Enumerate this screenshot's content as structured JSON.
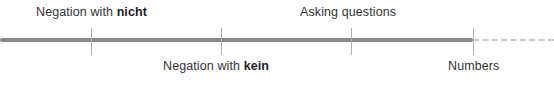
{
  "figure": {
    "type": "progress-timeline",
    "width": 554,
    "height": 87,
    "background_color": "#ffffff"
  },
  "axis": {
    "name": "course-progress-axis",
    "orientation": "horizontal",
    "center_y": 40,
    "solid": {
      "start_x": 0,
      "end_x": 473,
      "thickness": 4,
      "color": "#8a8a8e",
      "meaning": "completed"
    },
    "dashed": {
      "start_x": 473,
      "end_x": 554,
      "thickness": 2,
      "color": "#c9c9cf",
      "dash_pattern": "5px dash, 3px gap",
      "meaning": "upcoming"
    }
  },
  "tick_style": {
    "color": "#b0b0b4",
    "width": 1,
    "top_y": 28,
    "height": 27
  },
  "milestones": [
    {
      "id": "negation-nicht",
      "x": 91,
      "label_position": "above",
      "label_left": 36,
      "text_prefix": "Negation with ",
      "term": "nicht",
      "term_bold": true
    },
    {
      "id": "negation-kein",
      "x": 221,
      "label_position": "below",
      "label_left": 163,
      "text_prefix": "Negation with ",
      "term": "kein",
      "term_bold": true
    },
    {
      "id": "asking-questions",
      "x": 351,
      "label_position": "above",
      "label_left": 300,
      "text_prefix": "Asking questions",
      "term": "",
      "term_bold": false
    },
    {
      "id": "numbers",
      "x": 473,
      "label_position": "below",
      "label_left": 448,
      "text_prefix": "Numbers",
      "term": "",
      "term_bold": false
    }
  ]
}
